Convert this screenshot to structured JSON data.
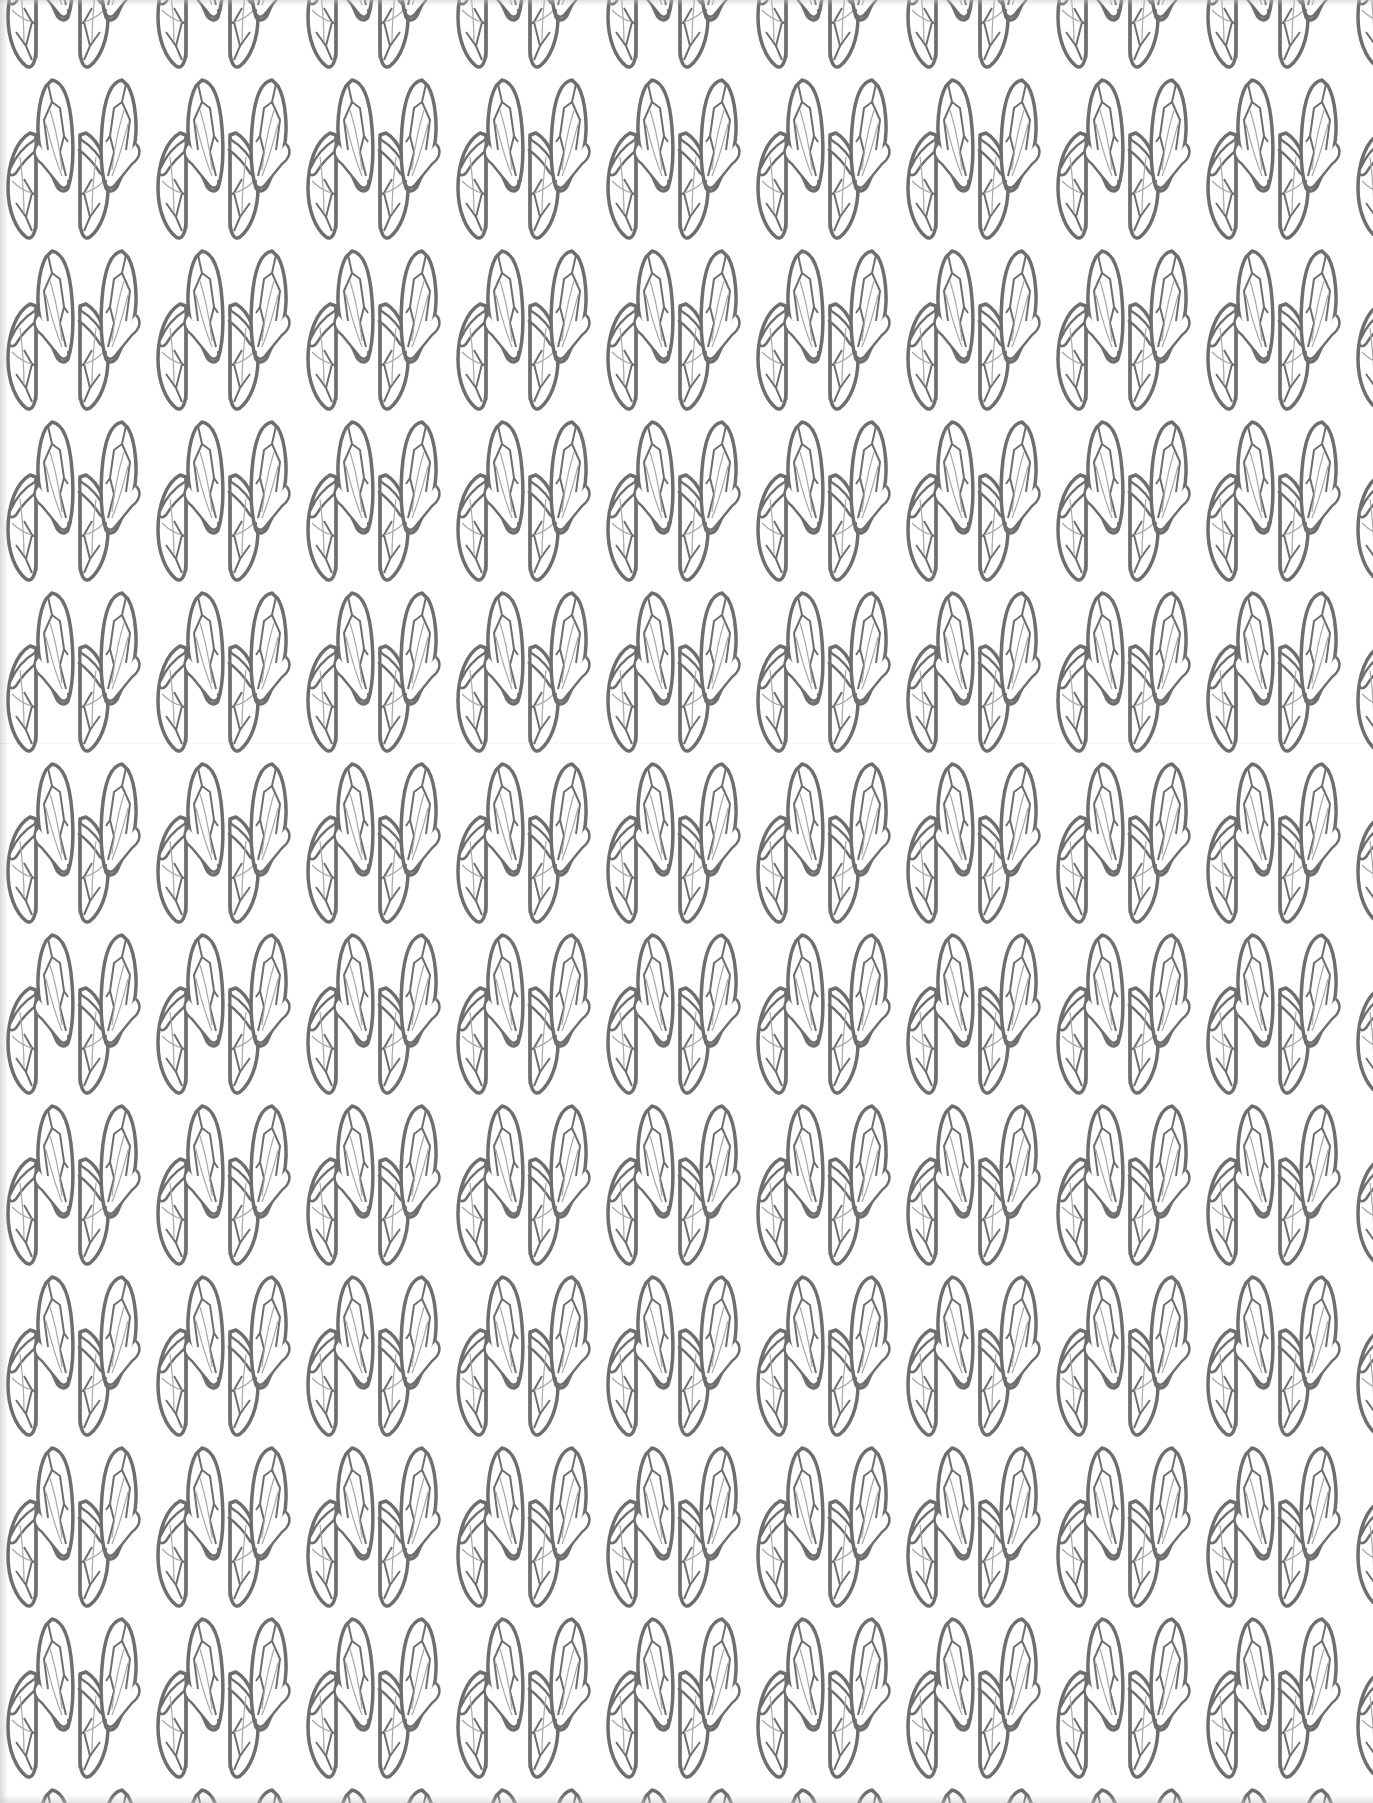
{
  "pattern": {
    "name": "cicada wings seamless pattern",
    "background_color": "#ffffff",
    "stroke_color": "#6e6e6e",
    "vein_color": "#9a9a9a",
    "tile_width": 150,
    "tile_height": 171,
    "rows_offset_x": 75,
    "motifs": [
      "upper-wing-pair",
      "lower-wing-pair"
    ]
  },
  "canvas": {
    "width": 1373,
    "height": 1803
  }
}
